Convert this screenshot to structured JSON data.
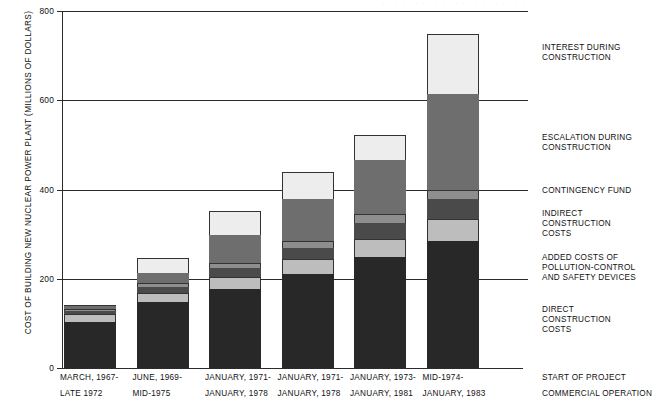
{
  "header_remnant": "· · · · · · · · · · · · · · · · · · · · · ·",
  "chart_data": {
    "type": "bar",
    "subtype": "stacked-bar",
    "title": "",
    "xlabel": "",
    "ylabel": "COST OF BUILDING NEW NUCLEAR POWER PLANT (MILLIONS OF DOLLARS)",
    "ylim": [
      0,
      800
    ],
    "yticks": [
      0,
      200,
      400,
      600,
      800
    ],
    "ytick_labels": [
      "0",
      "200",
      "400",
      "600",
      "800"
    ],
    "grid": true,
    "grid_axis": "y",
    "legend_position": "right",
    "categories": [
      "MARCH, 1967-\nLATE 1972",
      "JUNE, 1969-\nMID-1975",
      "JANUARY, 1971-\nJANUARY, 1978",
      "JANUARY, 1971-\nJANUARY, 1978",
      "JANUARY, 1973-\nJANUARY, 1981",
      "MID-1974-\nJANUARY, 1983"
    ],
    "category_lines": [
      {
        "line1": "MARCH, 1967-",
        "line2": "LATE 1972"
      },
      {
        "line1": "JUNE, 1969-",
        "line2": "MID-1975"
      },
      {
        "line1": "JANUARY, 1971-",
        "line2": "JANUARY, 1978"
      },
      {
        "line1": "JANUARY, 1971-",
        "line2": "JANUARY, 1978"
      },
      {
        "line1": "JANUARY, 1973-",
        "line2": "JANUARY, 1981"
      },
      {
        "line1": "MID-1974-",
        "line2": "JANUARY, 1983"
      }
    ],
    "row_key": {
      "line1": "START OF PROJECT",
      "line2": "COMMERCIAL OPERATION"
    },
    "series": [
      {
        "name": "DIRECT CONSTRUCTION COSTS",
        "legend_label": "DIRECT\nCONSTRUCTION\nCOSTS",
        "color": "#282828",
        "values": [
          103,
          148,
          178,
          210,
          248,
          285
        ]
      },
      {
        "name": "ADDED COSTS OF POLLUTION-CONTROL AND SAFETY DEVICES",
        "legend_label": "ADDED COSTS OF\nPOLLUTION-CONTROL\nAND SAFETY DEVICES",
        "color": "#bdbdbd",
        "values": [
          17,
          21,
          27,
          34,
          41,
          48
        ]
      },
      {
        "name": "INDIRECT CONSTRUCTION COSTS",
        "legend_label": "INDIRECT\nCONSTRUCTION\nCOSTS",
        "color": "#4a4a4a",
        "values": [
          8,
          13,
          18,
          24,
          36,
          45
        ]
      },
      {
        "name": "CONTINGENCY FUND",
        "legend_label": "CONTINGENCY FUND",
        "color": "#8e8e8e",
        "values": [
          5,
          9,
          12,
          16,
          20,
          22
        ]
      },
      {
        "name": "ESCALATION DURING CONSTRUCTION",
        "legend_label": "ESCALATION DURING\nCONSTRUCTION",
        "color": "#6e6e6e",
        "values": [
          5,
          22,
          64,
          95,
          122,
          215
        ]
      },
      {
        "name": "INTEREST DURING CONSTRUCTION",
        "legend_label": "INTEREST DURING\nCONSTRUCTION",
        "color": "#ededed",
        "values": [
          4,
          34,
          52,
          61,
          55,
          133
        ]
      }
    ],
    "totals": [
      142,
      247,
      351,
      440,
      522,
      748
    ]
  }
}
